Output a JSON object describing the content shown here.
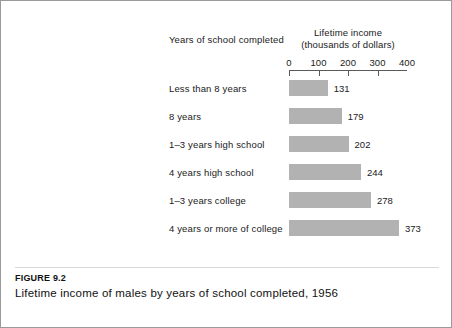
{
  "figure": {
    "caption_id": "FIGURE 9.2",
    "caption_text": "Lifetime income of males by years of school completed, 1956"
  },
  "headers": {
    "category_header": "Years of school completed",
    "value_header_line1": "Lifetime income",
    "value_header_line2": "(thousands of dollars)"
  },
  "colors": {
    "bar_fill": "#b2b2b2",
    "axis": "#5a5a5a",
    "frame": "#9a9a9a",
    "text": "#1a1a1a"
  },
  "chart_data": {
    "type": "bar",
    "orientation": "horizontal",
    "title": "Lifetime income of males by years of school completed, 1956",
    "xlabel": "Lifetime income (thousands of dollars)",
    "ylabel": "Years of school completed",
    "xlim": [
      0,
      400
    ],
    "xticks": [
      0,
      100,
      200,
      300,
      400
    ],
    "xtick_labels": [
      "0",
      "100",
      "200",
      "300",
      "400"
    ],
    "grid": false,
    "legend": "none",
    "categories": [
      "Less than 8 years",
      "8 years",
      "1–3 years high school",
      "4 years high school",
      "1–3 years college",
      "4 years or more of college"
    ],
    "values": [
      131,
      179,
      202,
      244,
      278,
      373
    ],
    "value_labels": [
      "131",
      "179",
      "202",
      "244",
      "278",
      "373"
    ]
  }
}
